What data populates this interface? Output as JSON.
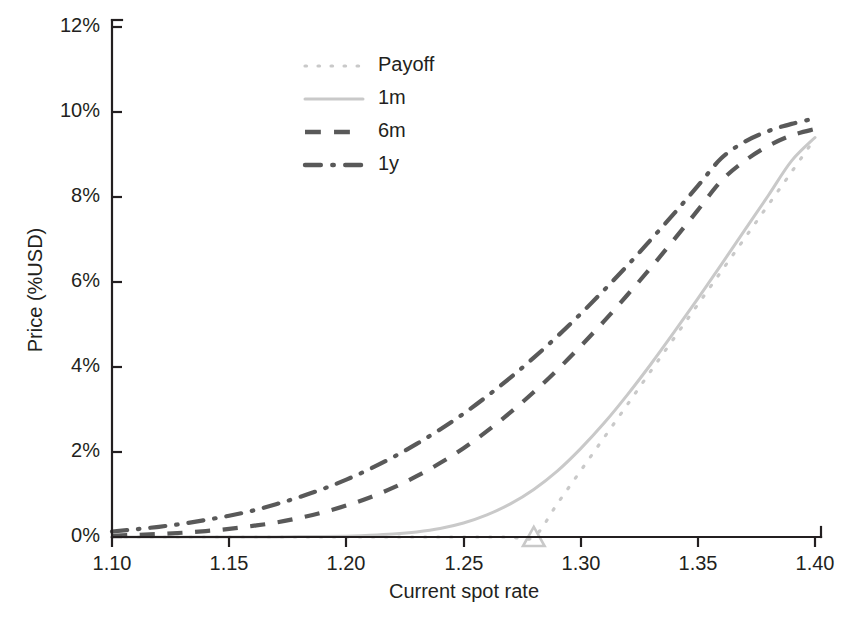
{
  "chart_data": {
    "type": "line",
    "title": "",
    "xlabel": "Current spot rate",
    "ylabel": "Price (%USD)",
    "xlim": [
      1.1,
      1.4
    ],
    "ylim": [
      0,
      12
    ],
    "xticks": [
      "1.10",
      "1.15",
      "1.20",
      "1.25",
      "1.30",
      "1.35",
      "1.40"
    ],
    "xtick_values": [
      1.1,
      1.15,
      1.2,
      1.25,
      1.3,
      1.35,
      1.4
    ],
    "yticks": [
      "0%",
      "2%",
      "4%",
      "6%",
      "8%",
      "10%",
      "12%"
    ],
    "ytick_values": [
      0,
      2,
      4,
      6,
      8,
      10,
      12
    ],
    "grid": false,
    "legend_position": "upper-center",
    "x": [
      1.1,
      1.11,
      1.12,
      1.13,
      1.14,
      1.15,
      1.16,
      1.17,
      1.18,
      1.19,
      1.2,
      1.21,
      1.22,
      1.23,
      1.24,
      1.25,
      1.26,
      1.27,
      1.28,
      1.29,
      1.3,
      1.31,
      1.32,
      1.33,
      1.34,
      1.35,
      1.36,
      1.37,
      1.38,
      1.39,
      1.4
    ],
    "series": [
      {
        "name": "Payoff",
        "style": "dotted",
        "color": "#c9c9c9",
        "values": [
          0,
          0,
          0,
          0,
          0,
          0,
          0,
          0,
          0,
          0,
          0,
          0,
          0,
          0,
          0,
          0,
          0,
          0,
          0,
          0.78,
          1.56,
          2.34,
          3.12,
          3.91,
          4.69,
          5.47,
          6.25,
          7.03,
          7.81,
          8.59,
          9.38
        ]
      },
      {
        "name": "1m",
        "style": "solid",
        "color": "#c9c9c9",
        "values": [
          0.0,
          0.0,
          0.0,
          0.0,
          0.0,
          0.0,
          0.0,
          0.0,
          0.01,
          0.01,
          0.02,
          0.04,
          0.07,
          0.12,
          0.2,
          0.33,
          0.52,
          0.78,
          1.12,
          1.55,
          2.08,
          2.68,
          3.35,
          4.07,
          4.83,
          5.61,
          6.41,
          7.22,
          8.03,
          8.85,
          9.4
        ]
      },
      {
        "name": "6m",
        "style": "dashed",
        "color": "#595959",
        "values": [
          0.03,
          0.05,
          0.07,
          0.1,
          0.14,
          0.19,
          0.26,
          0.34,
          0.45,
          0.58,
          0.74,
          0.93,
          1.16,
          1.43,
          1.74,
          2.09,
          2.49,
          2.93,
          3.41,
          3.93,
          4.49,
          5.08,
          5.7,
          6.34,
          7.01,
          7.69,
          8.38,
          8.85,
          9.2,
          9.45,
          9.6
        ]
      },
      {
        "name": "1y",
        "style": "dashdot",
        "color": "#595959",
        "values": [
          0.13,
          0.18,
          0.24,
          0.31,
          0.4,
          0.5,
          0.62,
          0.77,
          0.94,
          1.13,
          1.35,
          1.6,
          1.88,
          2.19,
          2.53,
          2.9,
          3.31,
          3.75,
          4.22,
          4.72,
          5.25,
          5.81,
          6.39,
          7.0,
          7.62,
          8.26,
          8.91,
          9.3,
          9.55,
          9.72,
          9.85
        ]
      }
    ],
    "markers": [
      {
        "name": "strike-marker",
        "shape": "triangle",
        "x": 1.28,
        "y": 0,
        "color": "#c9c9c9"
      }
    ]
  },
  "legend": {
    "items": [
      {
        "label": "Payoff",
        "style": "dotted",
        "color": "#c9c9c9"
      },
      {
        "label": "1m",
        "style": "solid",
        "color": "#c9c9c9"
      },
      {
        "label": "6m",
        "style": "dashed",
        "color": "#595959"
      },
      {
        "label": "1y",
        "style": "dashdot",
        "color": "#595959"
      }
    ]
  },
  "axes": {
    "x_title": "Current spot rate",
    "y_title": "Price (%USD)",
    "x_tick_labels": [
      "1.10",
      "1.15",
      "1.20",
      "1.25",
      "1.30",
      "1.35",
      "1.40"
    ],
    "y_tick_labels": [
      "0%",
      "2%",
      "4%",
      "6%",
      "8%",
      "10%",
      "12%"
    ]
  },
  "colors": {
    "axis": "#231f20",
    "light_gray": "#c9c9c9",
    "dark_gray": "#595959",
    "background": "#ffffff"
  }
}
